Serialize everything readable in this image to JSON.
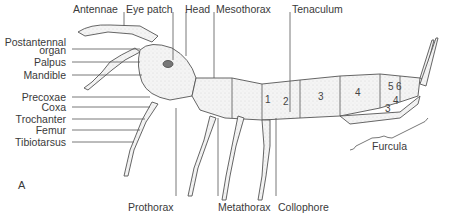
{
  "figure": {
    "panel_label": "A",
    "labels_top": [
      "Antennae",
      "Eye patch",
      "Head",
      "Mesothorax",
      "Tenaculum"
    ],
    "labels_left": [
      "Postantennal",
      "organ",
      "Palpus",
      "Mandible",
      "Precoxae",
      "Coxa",
      "Trochanter",
      "Femur",
      "Tibiotarsus"
    ],
    "labels_bottom": [
      "Prothorax",
      "Metathorax",
      "Collophore"
    ],
    "labels_right": [
      "Furcula"
    ],
    "segment_numbers": [
      "1",
      "2",
      "3",
      "4",
      "5",
      "6",
      "4",
      "3"
    ]
  }
}
